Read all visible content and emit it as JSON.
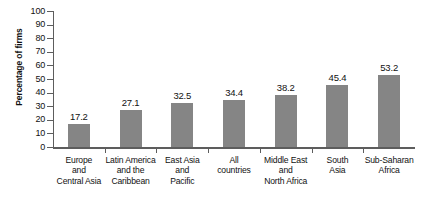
{
  "chart_data": {
    "type": "bar",
    "title": "",
    "xlabel": "",
    "ylabel": "Percentage of firms",
    "ylim": [
      0,
      100
    ],
    "ytick_step": 10,
    "yticks": [
      0,
      10,
      20,
      30,
      40,
      50,
      60,
      70,
      80,
      90,
      100
    ],
    "grid": false,
    "legend": "none",
    "bar_color": "#858585",
    "axis_color": "#5d5d5d",
    "categories": [
      "Europe and Central Asia",
      "Latin America and the Caribbean",
      "East Asia and Pacific",
      "All countries",
      "Middle East and North Africa",
      "South Asia",
      "Sub-Saharan Africa"
    ],
    "category_lines": [
      [
        "Europe",
        "and",
        "Central Asia"
      ],
      [
        "Latin America",
        "and the",
        "Caribbean"
      ],
      [
        "East Asia",
        "and",
        "Pacific"
      ],
      [
        "All",
        "countries"
      ],
      [
        "Middle East",
        "and",
        "North Africa"
      ],
      [
        "South",
        "Asia"
      ],
      [
        "Sub-Saharan",
        "Africa"
      ]
    ],
    "values": [
      17.2,
      27.1,
      32.5,
      34.4,
      38.2,
      45.4,
      53.2
    ],
    "value_labels": [
      "17.2",
      "27.1",
      "32.5",
      "34.4",
      "38.2",
      "45.4",
      "53.2"
    ]
  },
  "axis": {
    "y_title": "Percentage of firms",
    "tick_labels": [
      "100",
      "90",
      "80",
      "70",
      "60",
      "50",
      "40",
      "30",
      "20",
      "10",
      "0"
    ]
  },
  "title_sliver": {
    "text": ""
  }
}
